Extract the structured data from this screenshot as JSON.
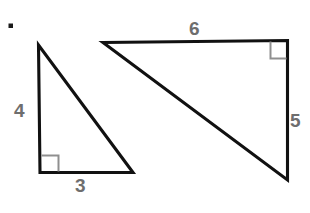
{
  "figure": {
    "background_color": "#ffffff",
    "stroke_color": "#111111",
    "label_color": "#6e6e6e",
    "right_angle_mark_color": "#8f8f8f",
    "bullet_marker": {
      "name": "bullet-dot",
      "x": 10,
      "y": 25,
      "size": 4,
      "color": "#1a1a1a"
    },
    "shapes": [
      {
        "name": "small-right-triangle",
        "right_angle_at": "bottom-left",
        "vertices": [
          {
            "name": "apex",
            "x": 38,
            "y": 45
          },
          {
            "name": "bottom-left",
            "x": 40,
            "y": 172
          },
          {
            "name": "bottom-right",
            "x": 133,
            "y": 172
          }
        ],
        "right_angle_mark": {
          "x": 40,
          "y": 155,
          "size": 17
        },
        "labels": [
          {
            "name": "vertical-leg-label",
            "text": "4",
            "side": "left"
          },
          {
            "name": "horizontal-leg-label",
            "text": "3",
            "side": "bottom"
          }
        ]
      },
      {
        "name": "large-right-triangle",
        "right_angle_at": "top-right",
        "vertices": [
          {
            "name": "top-left",
            "x": 103,
            "y": 42
          },
          {
            "name": "top-right",
            "x": 288,
            "y": 40
          },
          {
            "name": "bottom-right",
            "x": 288,
            "y": 180
          }
        ],
        "right_angle_mark": {
          "x": 271,
          "y": 40,
          "size": 17
        },
        "labels": [
          {
            "name": "horizontal-leg-label",
            "text": "6",
            "side": "top"
          },
          {
            "name": "vertical-leg-label",
            "text": "5",
            "side": "right"
          }
        ]
      }
    ]
  },
  "labels": {
    "small_vertical": "4",
    "small_horizontal": "3",
    "large_horizontal": "6",
    "large_vertical": "5"
  }
}
